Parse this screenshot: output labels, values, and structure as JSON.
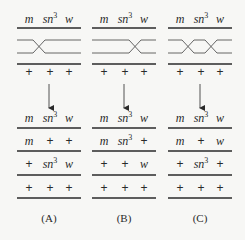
{
  "figure": {
    "colors": {
      "line": "#2a2a2a",
      "strand": "#555555",
      "background": "#f7f7f5"
    },
    "panels": [
      {
        "label": "(A)",
        "parent_top": [
          "m",
          "sn3",
          "w"
        ],
        "parent_bottom": [
          "+",
          "+",
          "+"
        ],
        "crossover": "between m and sn3",
        "products": [
          [
            "m",
            "sn3",
            "w"
          ],
          [
            "m",
            "+",
            "+"
          ],
          [
            "+",
            "sn3",
            "w"
          ],
          [
            "+",
            "+",
            "+"
          ]
        ]
      },
      {
        "label": "(B)",
        "parent_top": [
          "m",
          "sn3",
          "w"
        ],
        "parent_bottom": [
          "+",
          "+",
          "+"
        ],
        "crossover": "between sn3 and w",
        "products": [
          [
            "m",
            "sn3",
            "w"
          ],
          [
            "m",
            "sn3",
            "+"
          ],
          [
            "+",
            "+",
            "w"
          ],
          [
            "+",
            "+",
            "+"
          ]
        ]
      },
      {
        "label": "(C)",
        "parent_top": [
          "m",
          "sn3",
          "w"
        ],
        "parent_bottom": [
          "+",
          "+",
          "+"
        ],
        "crossover": "double crossover (between m and sn3, and between sn3 and w)",
        "products": [
          [
            "m",
            "sn3",
            "w"
          ],
          [
            "m",
            "+",
            "w"
          ],
          [
            "+",
            "sn3",
            "+"
          ],
          [
            "+",
            "+",
            "+"
          ]
        ]
      }
    ]
  }
}
